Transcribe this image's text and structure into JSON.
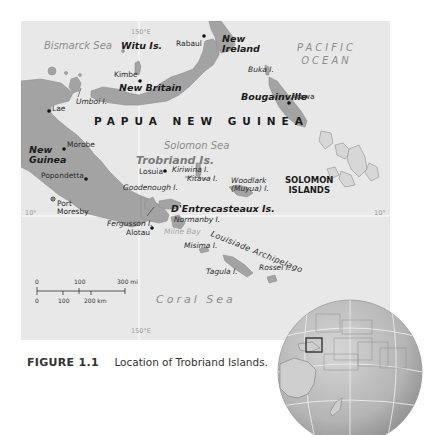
{
  "map": {
    "seas": {
      "bismarck": "Bismarck Sea",
      "solomon": "Solomon Sea",
      "coral": "Coral Sea",
      "milne_bay": "Milne Bay"
    },
    "ocean": {
      "line1": "PACIFIC",
      "line2": "OCEAN"
    },
    "countries": {
      "png": "PAPUA NEW GUINEA",
      "solomon_line1": "SOLOMON",
      "solomon_line2": "ISLANDS"
    },
    "major_islands": {
      "witu": "Witu Is.",
      "new_ireland_line1": "New",
      "new_ireland_line2": "Ireland",
      "new_britain": "New Britain",
      "bougainville": "Bougainville",
      "new_guinea_line1": "New",
      "new_guinea_line2": "Guinea",
      "trobriand": "Trobriand Is.",
      "dentrecasteaux": "D'Entrecasteaux Is."
    },
    "minor_islands": {
      "umboi": "Umboi I.",
      "buka": "Buka I.",
      "kiriwina": "Kiriwina I.",
      "kitava": "Kitava I.",
      "woodlark_line1": "Woodlark",
      "woodlark_line2": "(Muyua) I.",
      "goodenough": "Goodenough I.",
      "fergusson": "Fergusson I.",
      "normanby": "Normanby I.",
      "misima": "Misima I.",
      "tagula": "Tagula I.",
      "rossel": "Rossel I."
    },
    "archipelago": "Louisiade Archipelago",
    "towns": {
      "rabaul": "Rabaul",
      "kimbe": "Kimbe",
      "arawa": "Arawa",
      "lae": "Lae",
      "morobe": "Morobe",
      "popondetta": "Popondetta",
      "port_moresby_line1": "Port",
      "port_moresby_line2": "Moresby",
      "losuia": "Losuia",
      "alotau": "Alotau"
    },
    "coordinates": {
      "meridian_top": "150°E",
      "meridian_bottom": "150°E",
      "parallel_left": "10°",
      "parallel_right": "10°"
    },
    "scale_bar": {
      "miles_labels": [
        "0",
        "100",
        "300 mi"
      ],
      "km_labels": [
        "0",
        "100",
        "200 km"
      ]
    },
    "colors": {
      "sea": "#e8e8e8",
      "land": "#a3a3a3",
      "land_outline": "#8a8a8a",
      "gridline": "#ffffff"
    }
  },
  "caption": {
    "figure_label": "FIGURE 1.1",
    "text": "Location of Trobriand Islands."
  },
  "inset_globe": {
    "description": "Globe locator showing Pacific region with highlighted box around Trobriand Islands area"
  }
}
